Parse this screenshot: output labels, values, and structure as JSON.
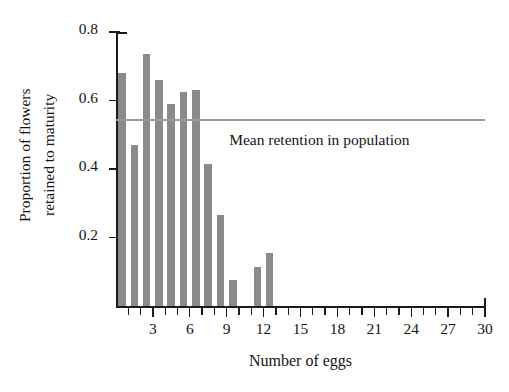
{
  "chart_data": {
    "type": "bar",
    "title": "",
    "xlabel": "Number of eggs",
    "ylabel": "Proportion of flowers retained to maturity",
    "ylabel_lines": [
      "Proportion of flowers",
      "retained to maturity"
    ],
    "categories": [
      1,
      2,
      3,
      4,
      5,
      6,
      7,
      8,
      9,
      10,
      11,
      12,
      13
    ],
    "values": [
      0.68,
      0.47,
      0.735,
      0.66,
      0.59,
      0.625,
      0.63,
      0.415,
      0.265,
      0.075,
      0,
      0.115,
      0.155
    ],
    "xlim": [
      0,
      30
    ],
    "ylim": [
      0,
      0.8
    ],
    "ytick_values": [
      0.2,
      0.4,
      0.6,
      0.8
    ],
    "ytick_labels": [
      "0.2",
      "0.4",
      "0.6",
      "0.8"
    ],
    "xtick_values": [
      1,
      2,
      3,
      4,
      5,
      6,
      7,
      8,
      9,
      10,
      11,
      12,
      13,
      14,
      15,
      16,
      17,
      18,
      19,
      20,
      21,
      22,
      23,
      24,
      25,
      26,
      27,
      28,
      29,
      30
    ],
    "xtick_labeled": [
      3,
      6,
      9,
      12,
      15,
      18,
      21,
      24,
      27,
      30
    ],
    "xtick_labels": [
      "3",
      "6",
      "9",
      "12",
      "15",
      "18",
      "21",
      "24",
      "27",
      "30"
    ],
    "grid": false,
    "legend": "none",
    "bar_color": "#8a8a8a",
    "axis_color": "#1a1a1a",
    "annotations": [
      {
        "name": "mean-retention-line",
        "label": "Mean retention in population",
        "value": 0.545,
        "orientation": "horizontal",
        "color": "#9b9b9b"
      }
    ]
  }
}
